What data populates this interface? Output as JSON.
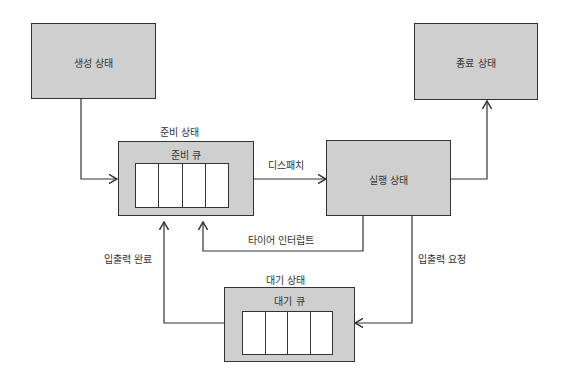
{
  "states": {
    "new": "생성 상태",
    "terminated": "종료 상태",
    "ready": "준비 상태",
    "running": "실행 상태",
    "waiting": "대기 상태"
  },
  "queues": {
    "ready_queue": "준비 큐",
    "wait_queue": "대기 큐",
    "slot_count": 4
  },
  "transitions": {
    "dispatch": "디스패치",
    "timer_interrupt": "타이어 인터럽트",
    "io_request": "입출력 요청",
    "io_complete": "입출력 완료"
  },
  "colors": {
    "box_fill": "#cfcfcf",
    "line": "#333333",
    "queue_fill": "#ffffff"
  }
}
